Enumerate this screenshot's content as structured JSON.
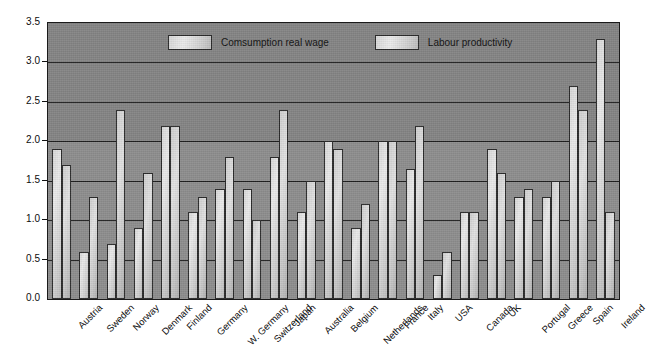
{
  "chart_data": {
    "type": "bar",
    "title": "",
    "xlabel": "",
    "ylabel": "",
    "ylim": [
      0.0,
      3.5
    ],
    "ytick_labels": [
      "0.0",
      "0.5",
      "1.0",
      "1.5",
      "2.0",
      "2.5",
      "3.0",
      "3.5"
    ],
    "ytick_values": [
      0.0,
      0.5,
      1.0,
      1.5,
      2.0,
      2.5,
      3.0,
      3.5
    ],
    "grid": true,
    "legend_position": "top-center",
    "categories": [
      "Austria",
      "Sweden",
      "Norway",
      "Denmark",
      "Finland",
      "Germany",
      "W. Germany",
      "Switzerland",
      "Japan",
      "Australia",
      "Belgium",
      "Netherlands",
      "France",
      "Italy",
      "USA",
      "Canada",
      "UK",
      "Portugal",
      "Greece",
      "Spain",
      "Ireland"
    ],
    "series": [
      {
        "name": "Comsumption real wage",
        "color": "#dcdcdc",
        "values": [
          1.9,
          0.6,
          0.7,
          0.9,
          2.2,
          1.1,
          1.4,
          1.4,
          1.8,
          1.1,
          2.0,
          0.9,
          2.0,
          1.65,
          0.3,
          1.1,
          1.9,
          1.3,
          1.3,
          2.7,
          3.3
        ]
      },
      {
        "name": "Labour productivity",
        "color": "#cccccc",
        "values": [
          1.7,
          1.3,
          2.4,
          1.6,
          2.2,
          1.3,
          1.8,
          1.0,
          2.4,
          1.5,
          1.9,
          1.2,
          2.0,
          2.2,
          0.6,
          1.1,
          1.6,
          1.4,
          1.5,
          2.4,
          1.1
        ]
      }
    ]
  },
  "legend": {
    "items": [
      {
        "label": "Comsumption real wage"
      },
      {
        "label": "Labour productivity"
      }
    ]
  },
  "colors": {
    "plot_background": "#858585",
    "gridline": "#1f1f1f",
    "axis_text": "#0d0d0d"
  }
}
